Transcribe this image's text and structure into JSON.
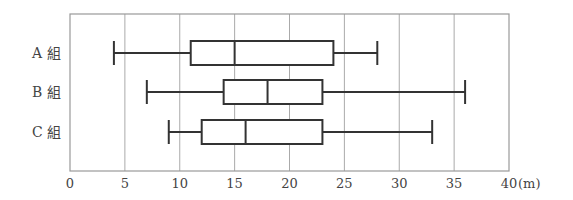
{
  "chart_data": {
    "type": "boxplot",
    "title": "",
    "xlabel": "(m)",
    "ylabel": "",
    "xlim": [
      0,
      40
    ],
    "xticks": [
      0,
      5,
      10,
      15,
      20,
      25,
      30,
      35,
      40
    ],
    "xtick_labels": [
      "0",
      "5",
      "10",
      "15",
      "20",
      "25",
      "30",
      "35",
      "40"
    ],
    "unit_label": "(m)",
    "grid": {
      "vertical": true,
      "horizontal": false
    },
    "orientation": "horizontal",
    "series": [
      {
        "name": "A 組",
        "min": 4,
        "q1": 11,
        "median": 15,
        "q3": 24,
        "max": 28
      },
      {
        "name": "B 組",
        "min": 7,
        "q1": 14,
        "median": 18,
        "q3": 23,
        "max": 36
      },
      {
        "name": "C 組",
        "min": 9,
        "q1": 12,
        "median": 16,
        "q3": 23,
        "max": 33
      }
    ]
  },
  "colors": {
    "frame": "#999999",
    "grid": "#aaaaaa",
    "box": "#333333",
    "text": "#444444"
  }
}
